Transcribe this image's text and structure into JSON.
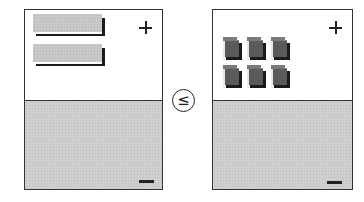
{
  "diagram": {
    "comparison_symbol": "≤",
    "left_panel": {
      "top_sign": "+",
      "bottom_sign": "−",
      "items": [
        {
          "shape": "bar",
          "label": ""
        },
        {
          "shape": "bar",
          "label": ""
        }
      ]
    },
    "right_panel": {
      "top_sign": "+",
      "bottom_sign": "−",
      "items": [
        {
          "shape": "cube"
        },
        {
          "shape": "cube"
        },
        {
          "shape": "cube"
        },
        {
          "shape": "cube"
        },
        {
          "shape": "cube"
        },
        {
          "shape": "cube"
        }
      ]
    },
    "colors": {
      "border": "#333333",
      "bottom_fill": "#cfcfcf",
      "bar_face": "#c8c8c8",
      "cube_face": "#5a5a5a",
      "shadow": "#1a1a1a"
    }
  }
}
